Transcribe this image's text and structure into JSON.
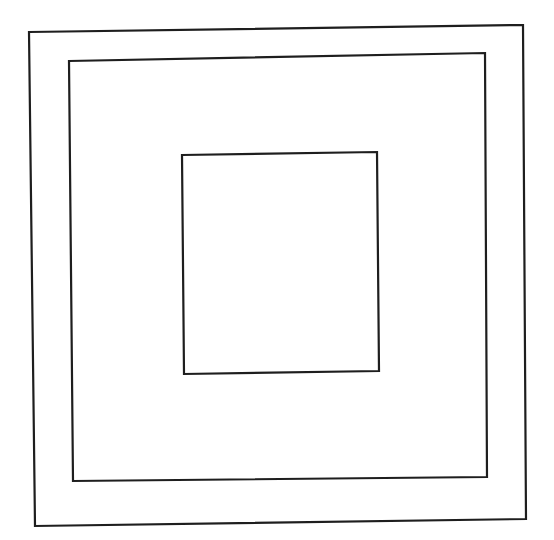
{
  "canvas": {
    "width": 554,
    "height": 540,
    "background": "#ffffff"
  },
  "diagram": {
    "stroke_color": "#1e1e1e",
    "shapes": [
      {
        "name": "outer-square",
        "stroke_width": 2.2,
        "points": "29,32 523,25 526,519 35,526"
      },
      {
        "name": "middle-square",
        "stroke_width": 2.2,
        "points": "69,61 485,53 487,477 73,481"
      },
      {
        "name": "inner-rectangle",
        "stroke_width": 2.2,
        "points": "182,155 377,152 379,371 184,374"
      }
    ]
  }
}
